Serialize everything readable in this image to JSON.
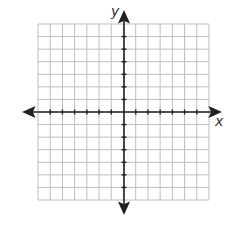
{
  "diagram": {
    "type": "coordinate-plane",
    "x_axis_label": "x",
    "y_axis_label": "y",
    "grid": {
      "columns": 14,
      "rows": 14,
      "cells_left_of_y_axis": 7,
      "cells_right_of_y_axis": 7,
      "cells_above_x_axis": 7,
      "cells_below_x_axis": 7
    },
    "colors": {
      "grid_line": "#bdbdbd",
      "axis": "#222222",
      "background": "#ffffff"
    }
  }
}
